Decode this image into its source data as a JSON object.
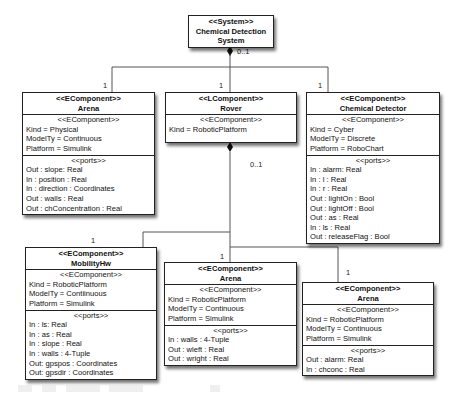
{
  "system": {
    "stereotype": "<<System>>",
    "name_line1": "Chemical Detection",
    "name_line2": "System",
    "multiplicity": "0..1"
  },
  "top_level": {
    "arena": {
      "stereotype": "<<EComponent>>",
      "name": "Arena",
      "multiplicity": "1",
      "props_stereotype": "<<EComponent>>",
      "props": [
        "Kind = Physical",
        "ModelTy = Continuous",
        "Platform = Simulink"
      ],
      "ports_stereotype": "<<ports>>",
      "ports": [
        "Out : slope: Real",
        "In : position : Real",
        "In : direction : Coordinates",
        "Out : walls : Real",
        "Out : chConcentration : Real"
      ]
    },
    "rover": {
      "stereotype": "<<LComponent>>",
      "name": "Rover",
      "multiplicity": "1",
      "props_stereotype": "<<EComponent>>",
      "props": [
        "Kind = RoboticPlatform"
      ],
      "child_multiplicity": "0..1"
    },
    "chemical_detector": {
      "stereotype": "<<EComponent>>",
      "name": "Chemical Detector",
      "multiplicity": "1",
      "props_stereotype": "<<EComponent>>",
      "props": [
        "Kind = Cyber",
        "ModelTy = Discrete",
        "Platform = RoboChart"
      ],
      "ports_stereotype": "<<ports>>",
      "ports": [
        "In : alarm: Real",
        "In : l : Real",
        "In : r : Real",
        "Out : lightOn : Bool",
        "Out : lightOff : Bool",
        "Out : as : Real",
        "In : ls : Real",
        "Out : releaseFlag : Bool"
      ]
    }
  },
  "rover_children": {
    "mobility_hw": {
      "stereotype": "<<EComponent>>",
      "name": "MobilityHw",
      "multiplicity": "1",
      "props_stereotype": "<<EComponent>>",
      "props": [
        "Kind = RoboticPlatform",
        "ModelTy = Contiinuous",
        "Platform = Simulink"
      ],
      "ports_stereotype": "<<ports>>",
      "ports": [
        "In : ls: Real",
        "In : as : Real",
        "In : slope : Real",
        "In : walls : 4-Tuple",
        "Out: gpspos : Coordinates",
        "Out: gpsdir : Coordinates"
      ]
    },
    "arena_mid": {
      "stereotype": "<<EComponent>>",
      "name": "Arena",
      "multiplicity": "1",
      "props_stereotype": "<<EComponent>>",
      "props": [
        "Kind = RoboticPlatform",
        "ModelTy = Continuous",
        "Platform = Simulink"
      ],
      "ports_stereotype": "<<ports>>",
      "ports": [
        "In : walls : 4-Tuple",
        "Out : wleft : Real",
        "Out : wright : Real"
      ]
    },
    "arena_right": {
      "stereotype": "<<EComponent>>",
      "name": "Arena",
      "multiplicity": "1",
      "props_stereotype": "<<EComponent>>",
      "props": [
        "Kind = RoboticPlatform",
        "ModelTy = Continuous",
        "Platform = Simulink"
      ],
      "ports_stereotype": "<<ports>>",
      "ports": [
        "Out : alarm: Real",
        "In : chconc : Real"
      ]
    }
  }
}
